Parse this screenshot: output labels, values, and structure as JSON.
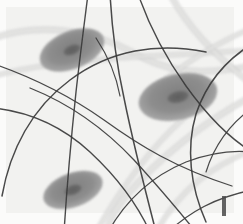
{
  "image": {
    "title": "Grayscale microscopy field",
    "width": 243,
    "height": 224,
    "background_color": "#f2f2f0",
    "margin_color": "#fbfbfa",
    "caption": ""
  },
  "palette": {
    "background": "#f2f2f0",
    "background_light": "#fafaf9",
    "cell_body": "#8d8d8d",
    "cell_body_edge": "#a6a6a6",
    "nucleus": "#6a6a6a",
    "fiber_dark": "#3a3a3a",
    "fiber_dark_soft": "#555555",
    "band_light": "#cfcfcf",
    "band_light_core": "#e2e2e0",
    "tick_mark": "#4a4a4a"
  },
  "cells": [
    {
      "name": "cell-top-left",
      "cx": 72,
      "cy": 50,
      "rx": 34,
      "ry": 19,
      "rotation": -22,
      "nucleus_rx": 9,
      "nucleus_ry": 5,
      "label": "Cell 1"
    },
    {
      "name": "cell-middle-right",
      "cx": 178,
      "cy": 97,
      "rx": 40,
      "ry": 23,
      "rotation": -13,
      "nucleus_rx": 11,
      "nucleus_ry": 6,
      "label": "Cell 2"
    },
    {
      "name": "cell-bottom-left",
      "cx": 73,
      "cy": 190,
      "rx": 31,
      "ry": 17,
      "rotation": -20,
      "nucleus_rx": 9,
      "nucleus_ry": 5,
      "label": "Cell 3"
    }
  ],
  "light_bands": [
    {
      "name": "band-upper-left-arc",
      "path": "M -6 38 C 40 22 92 30 132 52 C 160 68 190 78 250 66",
      "width": 5
    },
    {
      "name": "band-left-horizontal",
      "path": "M -6 76 C 30 66 70 62 118 58 C 160 55 200 54 250 50",
      "width": 4
    },
    {
      "name": "band-top-right-diagonal",
      "path": "M 170 -6 C 186 24 212 54 252 84",
      "width": 5
    },
    {
      "name": "band-right-upper-diagonal",
      "path": "M 252 28 C 214 44 180 66 150 92",
      "width": 4
    },
    {
      "name": "band-center-descending",
      "path": "M 252 96 C 208 120 166 150 126 196 C 116 208 110 220 106 232",
      "width": 5
    },
    {
      "name": "band-bottom-diagonal",
      "path": "M 252 150 C 214 166 182 186 156 232",
      "width": 4
    },
    {
      "name": "band-lower-left-sweep",
      "path": "M 96 232 C 120 190 148 150 184 118",
      "width": 4
    }
  ],
  "fibers": [
    {
      "name": "fiber-top-1",
      "path": "M 88 -6 C 84 26 80 56 76 92 C 72 130 68 170 64 232",
      "width": 1.4
    },
    {
      "name": "fiber-top-2",
      "path": "M 110 -6 C 112 30 116 62 124 98 C 132 138 142 178 156 232",
      "width": 1.5
    },
    {
      "name": "fiber-top-3",
      "path": "M 138 -6 C 150 28 166 58 186 86 C 206 114 226 136 252 152",
      "width": 1.4
    },
    {
      "name": "fiber-left-arc",
      "path": "M -6 108 C 30 112 62 126 90 152 C 118 178 138 206 150 232",
      "width": 1.4
    },
    {
      "name": "fiber-left-upper",
      "path": "M -6 64 C 34 78 70 96 104 120 C 140 146 176 168 232 186",
      "width": 1.3
    },
    {
      "name": "fiber-big-arc",
      "path": "M 2 196 C 10 150 32 108 70 80 C 110 50 158 42 206 52",
      "width": 1.5
    },
    {
      "name": "fiber-right-arc",
      "path": "M 252 44 C 226 60 206 84 196 114 C 186 148 190 186 206 222",
      "width": 1.5
    },
    {
      "name": "fiber-mid-cross",
      "path": "M 30 88 C 70 104 104 128 134 160 C 158 186 178 210 196 232",
      "width": 1.3
    },
    {
      "name": "fiber-lower-sweep",
      "path": "M 108 232 C 126 200 152 176 186 162 C 212 152 234 150 252 152",
      "width": 1.3
    },
    {
      "name": "fiber-bottom-right",
      "path": "M 168 232 C 190 212 214 198 252 190",
      "width": 1.4
    },
    {
      "name": "fiber-short-upper-left",
      "path": "M 96 38 C 108 56 116 74 120 96",
      "width": 1.2
    },
    {
      "name": "fiber-right-edge-curve",
      "path": "M 252 108 C 230 124 214 146 206 172",
      "width": 1.2
    }
  ],
  "tick_mark": {
    "name": "bottom-right-tick",
    "x": 222,
    "y": 196,
    "width": 4,
    "height": 20
  }
}
